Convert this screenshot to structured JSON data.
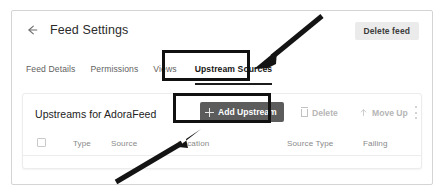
{
  "header": {
    "back_icon": "back-arrow-icon",
    "title": "Feed Settings",
    "delete_feed_label": "Delete feed"
  },
  "tabs": [
    {
      "label": "Feed Details",
      "active": false
    },
    {
      "label": "Permissions",
      "active": false
    },
    {
      "label": "Views",
      "active": false
    },
    {
      "label": "Upstream Sources",
      "active": true
    }
  ],
  "panel": {
    "title": "Upstreams for AdoraFeed",
    "add_upstream_label": "Add Upstream",
    "add_upstream_icon": "plus-icon",
    "delete_label": "Delete",
    "delete_icon": "trash-icon",
    "move_up_label": "Move Up",
    "move_up_icon": "arrow-up-icon",
    "overflow_icon": "kebab-menu-icon"
  },
  "table": {
    "columns": [
      {
        "label": "Type",
        "x": 50
      },
      {
        "label": "Source",
        "x": 88
      },
      {
        "label": "Location",
        "x": 155
      },
      {
        "label": "Source Type",
        "x": 264
      },
      {
        "label": "Failing",
        "x": 340
      }
    ],
    "select_all_checkbox": "select-all-checkbox"
  },
  "colors": {
    "accent_button": "#5c5c5c",
    "annotation": "#111111",
    "muted_text": "#8a8a8a",
    "card_border": "#d4d4d4"
  }
}
